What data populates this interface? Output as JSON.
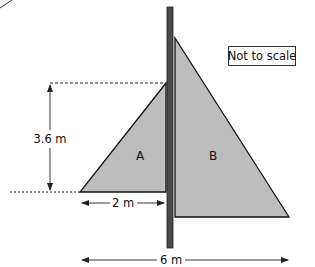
{
  "diagram": {
    "note": "Not to scale",
    "shapes": {
      "triangle_a": {
        "label": "A"
      },
      "triangle_b": {
        "label": "B"
      },
      "pole": {
        "label": ""
      }
    },
    "dimensions": {
      "height": "3.6 m",
      "width_a": "2 m",
      "total_width": "6 m"
    },
    "colors": {
      "fill": "#bdbdbd",
      "pole": "#4a4a4a",
      "stroke": "#111111"
    }
  }
}
